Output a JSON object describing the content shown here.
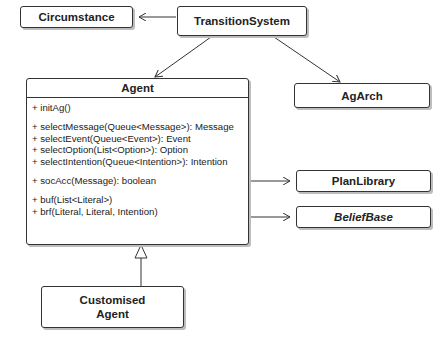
{
  "classes": {
    "circumstance": {
      "name": "Circumstance"
    },
    "transition_system": {
      "name": "TransitionSystem"
    },
    "agarch": {
      "name": "AgArch"
    },
    "plan_library": {
      "name": "PlanLibrary"
    },
    "belief_base": {
      "name": "BeliefBase",
      "style": "italic"
    },
    "customised_agent": {
      "name_line1": "Customised",
      "name_line2": "Agent"
    },
    "agent": {
      "name": "Agent",
      "methods": [
        [
          "+ initAg()"
        ],
        [
          "+ selectMessage(Queue<Message>): Message",
          "+ selectEvent(Queue<Event>): Event",
          "+ selectOption(List<Option>): Option",
          "+ selectIntention(Queue<Intention>): Intention"
        ],
        [
          "+ socAcc(Message): boolean"
        ],
        [
          "+ buf(List<Literal>)",
          "+ brf(Literal, Literal,  Intention)"
        ]
      ]
    }
  },
  "relations": [
    {
      "from": "TransitionSystem",
      "to": "Circumstance",
      "type": "association-arrow"
    },
    {
      "from": "TransitionSystem",
      "to": "Agent",
      "type": "bidirectional-arrow"
    },
    {
      "from": "TransitionSystem",
      "to": "AgArch",
      "type": "bidirectional-arrow"
    },
    {
      "from": "Agent",
      "to": "PlanLibrary",
      "type": "association-arrow"
    },
    {
      "from": "Agent",
      "to": "BeliefBase",
      "type": "association-arrow"
    },
    {
      "from": "Customised Agent",
      "to": "Agent",
      "type": "generalization"
    }
  ]
}
